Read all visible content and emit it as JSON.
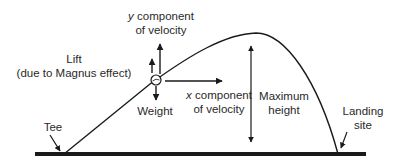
{
  "diagram": {
    "type": "projectile-trajectory",
    "labels": {
      "y_component": {
        "var": "y",
        "line1_rest": " component",
        "line2": "of velocity"
      },
      "lift": {
        "line1": "Lift",
        "line2": "(due to Magnus effect)"
      },
      "weight": "Weight",
      "x_component": {
        "var": "x",
        "line1_rest": " component",
        "line2": "of velocity"
      },
      "max_height": {
        "line1": "Maximum",
        "line2": "height"
      },
      "tee": "Tee",
      "landing": {
        "line1": "Landing",
        "line2": "site"
      }
    },
    "colors": {
      "stroke": "#1a1a1a",
      "ground": "#1a1a1a",
      "background": "#ffffff"
    }
  }
}
